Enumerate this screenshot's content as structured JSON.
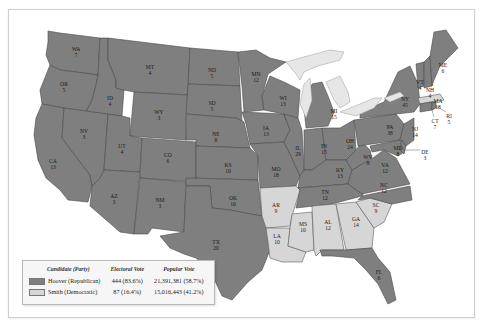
{
  "map": {
    "title": "Election of 1928",
    "colors": {
      "republican": "#7f7f7f",
      "democratic": "#d6d6d6",
      "water": "#e6e6e6",
      "border": "#4a4a4a"
    },
    "states": [
      {
        "abbr": "WA",
        "votes": "7",
        "party": "R"
      },
      {
        "abbr": "OR",
        "votes": "5",
        "party": "R"
      },
      {
        "abbr": "CA",
        "votes": "13",
        "party": "R"
      },
      {
        "abbr": "ID",
        "votes": "4",
        "party": "R"
      },
      {
        "abbr": "NV",
        "votes": "3",
        "party": "R"
      },
      {
        "abbr": "MT",
        "votes": "4",
        "party": "R"
      },
      {
        "abbr": "WY",
        "votes": "3",
        "party": "R"
      },
      {
        "abbr": "UT",
        "votes": "4",
        "party": "R"
      },
      {
        "abbr": "AZ",
        "votes": "3",
        "party": "R"
      },
      {
        "abbr": "CO",
        "votes": "6",
        "party": "R"
      },
      {
        "abbr": "NM",
        "votes": "3",
        "party": "R"
      },
      {
        "abbr": "ND",
        "votes": "5",
        "party": "R"
      },
      {
        "abbr": "SD",
        "votes": "5",
        "party": "R"
      },
      {
        "abbr": "NE",
        "votes": "8",
        "party": "R"
      },
      {
        "abbr": "KS",
        "votes": "10",
        "party": "R"
      },
      {
        "abbr": "OK",
        "votes": "10",
        "party": "R"
      },
      {
        "abbr": "TX",
        "votes": "20",
        "party": "R"
      },
      {
        "abbr": "MN",
        "votes": "12",
        "party": "R"
      },
      {
        "abbr": "IA",
        "votes": "13",
        "party": "R"
      },
      {
        "abbr": "MO",
        "votes": "18",
        "party": "R"
      },
      {
        "abbr": "AR",
        "votes": "9",
        "party": "D"
      },
      {
        "abbr": "LA",
        "votes": "10",
        "party": "D"
      },
      {
        "abbr": "WI",
        "votes": "13",
        "party": "R"
      },
      {
        "abbr": "IL",
        "votes": "29",
        "party": "R"
      },
      {
        "abbr": "MS",
        "votes": "10",
        "party": "D"
      },
      {
        "abbr": "MI",
        "votes": "15",
        "party": "R"
      },
      {
        "abbr": "IN",
        "votes": "15",
        "party": "R"
      },
      {
        "abbr": "KY",
        "votes": "13",
        "party": "R"
      },
      {
        "abbr": "TN",
        "votes": "12",
        "party": "R"
      },
      {
        "abbr": "AL",
        "votes": "12",
        "party": "D"
      },
      {
        "abbr": "GA",
        "votes": "14",
        "party": "D"
      },
      {
        "abbr": "FL",
        "votes": "6",
        "party": "R"
      },
      {
        "abbr": "SC",
        "votes": "9",
        "party": "D"
      },
      {
        "abbr": "NC",
        "votes": "12",
        "party": "R"
      },
      {
        "abbr": "VA",
        "votes": "12",
        "party": "R"
      },
      {
        "abbr": "WV",
        "votes": "8",
        "party": "R"
      },
      {
        "abbr": "OH",
        "votes": "24",
        "party": "R"
      },
      {
        "abbr": "PA",
        "votes": "38",
        "party": "R"
      },
      {
        "abbr": "NY",
        "votes": "45",
        "party": "R"
      },
      {
        "abbr": "NJ",
        "votes": "14",
        "party": "R"
      },
      {
        "abbr": "DE",
        "votes": "3",
        "party": "R"
      },
      {
        "abbr": "MD",
        "votes": "8",
        "party": "R"
      },
      {
        "abbr": "CT",
        "votes": "7",
        "party": "R"
      },
      {
        "abbr": "RI",
        "votes": "5",
        "party": "R"
      },
      {
        "abbr": "MA",
        "votes": "18",
        "party": "D"
      },
      {
        "abbr": "VT",
        "votes": "4",
        "party": "R"
      },
      {
        "abbr": "NH",
        "votes": "4",
        "party": "R"
      },
      {
        "abbr": "ME",
        "votes": "6",
        "party": "R"
      }
    ]
  },
  "legend": {
    "headers": {
      "candidate": "Candidate (Party)",
      "electoral": "Electoral Vote",
      "popular": "Popular Vote"
    },
    "rows": [
      {
        "candidate": "Hoover (Republican)",
        "electoral": "444 (83.6%)",
        "popular": "21,391,381 (58.7%)",
        "color": "#7f7f7f"
      },
      {
        "candidate": "Smith (Democratic)",
        "electoral": "87 (16.4%)",
        "popular": "15,016,443 (41.2%)",
        "color": "#d6d6d6"
      }
    ]
  }
}
